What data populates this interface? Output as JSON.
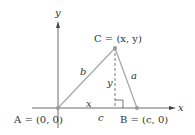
{
  "diagram": {
    "axes": {
      "x_label": "x",
      "y_label": "y"
    },
    "points": {
      "A": {
        "label": "A = (0, 0)"
      },
      "B": {
        "label": "B = (c, 0)"
      },
      "C": {
        "label": "C = (x, y)"
      }
    },
    "sides": {
      "a": "a",
      "b": "b",
      "c": "c"
    },
    "segments": {
      "base_x": "x",
      "height_y": "y"
    },
    "colors": {
      "triangle": "#a8a8a8",
      "points": "#999999",
      "axes": "#333333",
      "text": "#333333"
    }
  }
}
